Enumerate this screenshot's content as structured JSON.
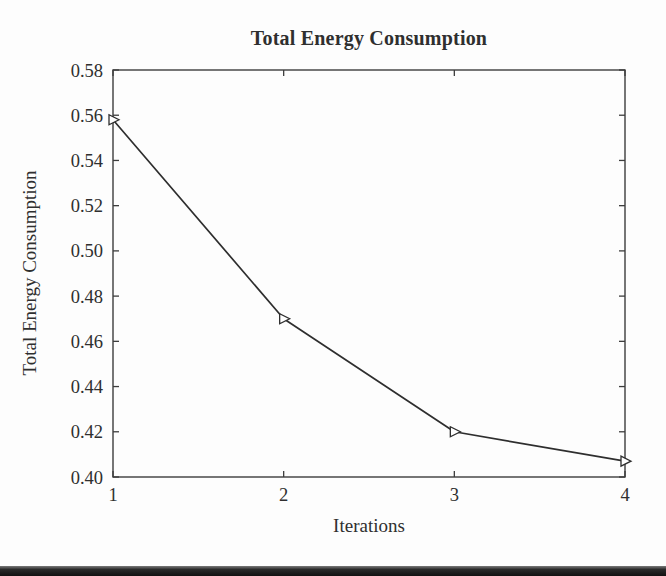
{
  "page": {
    "background": "#fdfdfd",
    "bottom_bar_color": "#1b1b1b"
  },
  "chart_data": {
    "type": "line",
    "title": "Total Energy Consumption",
    "xlabel": "Iterations",
    "ylabel": "Total Energy Consumption",
    "x": [
      1,
      2,
      3,
      4
    ],
    "y": [
      0.558,
      0.47,
      0.42,
      0.407
    ],
    "xlim": [
      1,
      4
    ],
    "ylim": [
      0.4,
      0.58
    ],
    "x_ticks": [
      "1",
      "2",
      "3",
      "4"
    ],
    "y_ticks": [
      "0.40",
      "0.42",
      "0.44",
      "0.46",
      "0.48",
      "0.50",
      "0.52",
      "0.54",
      "0.56",
      "0.58"
    ],
    "grid": false,
    "marker": "open-right-triangle",
    "line_color": "#2e2e2e",
    "axis_color": "#3d3d3d",
    "marker_fill": "#ffffff",
    "text_color": "#2f2f2f"
  }
}
